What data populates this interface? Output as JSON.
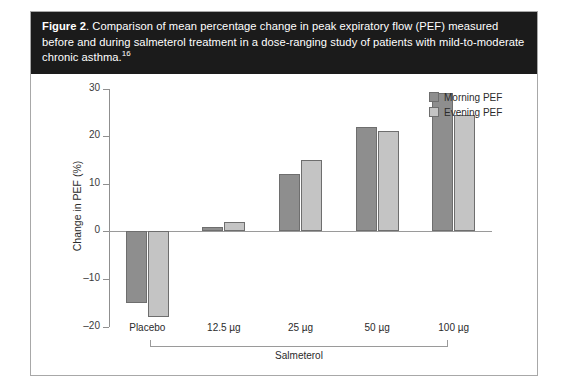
{
  "figure": {
    "label": "Figure 2",
    "caption_separator": ". ",
    "caption": "Comparison of mean percentage change in peak expiratory flow (PEF) measured before and during salmeterol treatment in a dose-ranging study of patients with mild-to-moderate chronic asthma.",
    "reference_superscript": "16"
  },
  "colors": {
    "caption_bar_background": "#1b1b1b",
    "caption_text": "#ffffff",
    "card_border": "#a8a8a8",
    "morning_bar": "#8e8e8e",
    "evening_bar": "#c4c4c4",
    "bar_outline": "#6e6e6e",
    "axis_line": "#8f8f8f"
  },
  "chart_data": {
    "type": "bar",
    "title": "",
    "xlabel": "Salmeterol",
    "ylabel": "Change in PEF (%)",
    "categories": [
      "Placebo",
      "12.5 µg",
      "25 µg",
      "50 µg",
      "100 µg"
    ],
    "series": [
      {
        "name": "Morning PEF",
        "color": "#8e8e8e",
        "values": [
          -15,
          1,
          12,
          22,
          29
        ]
      },
      {
        "name": "Evening PEF",
        "color": "#c4c4c4",
        "values": [
          -18,
          2,
          15,
          21,
          24.5
        ]
      }
    ],
    "ylim": [
      -20,
      30
    ],
    "yticks": [
      30,
      20,
      10,
      0,
      -10,
      -20
    ],
    "ytick_labels": [
      "30",
      "20",
      "10",
      "0",
      "–10",
      "–20"
    ],
    "grid": false,
    "legend_position": "top-right",
    "annotations": [
      {
        "type": "bracket",
        "label": "Salmeterol",
        "spans": [
          "12.5 µg",
          "100 µg"
        ]
      }
    ]
  },
  "legend": {
    "entries": [
      {
        "label": "Morning PEF",
        "swatch": "morning"
      },
      {
        "label": "Evening PEF",
        "swatch": "evening"
      }
    ]
  }
}
